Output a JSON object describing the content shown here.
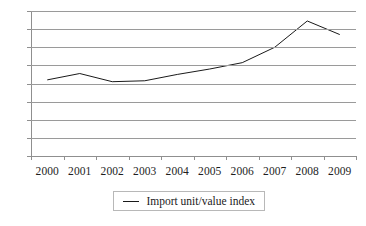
{
  "chart_data": {
    "type": "line",
    "title": "",
    "subtitle": "",
    "xlabel": "",
    "ylabel": "",
    "categories": [
      "2000",
      "2001",
      "2002",
      "2003",
      "2004",
      "2005",
      "2006",
      "2007",
      "2008",
      "2009"
    ],
    "series": [
      {
        "name": "Import unit/value index",
        "color": "#1a1a1a",
        "values": [
          84,
          91,
          82,
          83,
          90,
          96,
          103,
          120,
          149,
          134
        ]
      }
    ],
    "ylim": [
      0,
      160
    ],
    "yticks": [
      0,
      20,
      40,
      60,
      80,
      100,
      120,
      140,
      160
    ],
    "ytick_labels": [
      "0",
      "20",
      "40",
      "60",
      "80",
      "100",
      "120",
      "140",
      "160"
    ],
    "grid": true,
    "grid_axis": "y",
    "legend_position": "bottom-center",
    "legend_entries": [
      "Import unit/value index"
    ],
    "annotations": []
  },
  "legend": {
    "label": "Import unit/value index",
    "swatch": "line-swatch-icon"
  }
}
